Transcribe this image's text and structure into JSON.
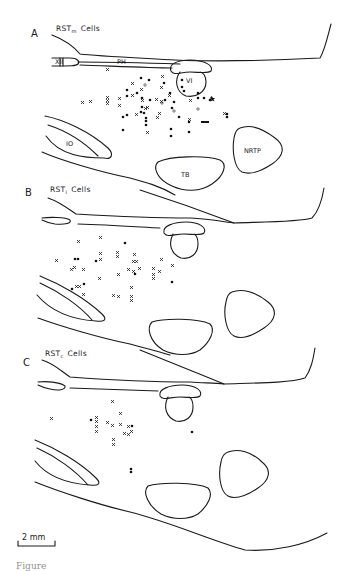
{
  "figure": {
    "panels": [
      {
        "letter": "A",
        "title": "RST",
        "subscript": "m",
        "suffix": "Cells",
        "structure_labels": {
          "xii": "XII",
          "ph": "PH",
          "vi": "VI",
          "io": "IO",
          "tb": "TB",
          "nrtp": "NRTP"
        }
      },
      {
        "letter": "B",
        "title": "RST",
        "subscript": "i",
        "suffix": "Cells"
      },
      {
        "letter": "C",
        "title": "RST",
        "subscript": "c",
        "suffix": "Cells"
      }
    ],
    "legend_markers": {
      "cross": "x",
      "filled_dot": "filled-circle",
      "open_dot": "open-circle"
    },
    "scale_bar": {
      "label": "2 mm"
    },
    "caption_fragment": "Figure"
  }
}
